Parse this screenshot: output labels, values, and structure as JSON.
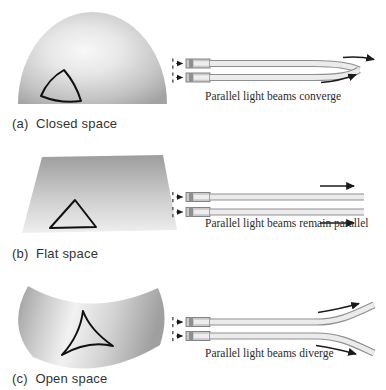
{
  "figure": {
    "panels": [
      {
        "id": "a",
        "label": "(a)  Closed space",
        "caption": "Parallel light beams converge",
        "surface": "dome",
        "triangle_style": "sides bulge outward",
        "beam_behavior": "converge"
      },
      {
        "id": "b",
        "label": "(b)  Flat space",
        "caption": "Parallel light beams remain parallel",
        "surface": "flat plane",
        "triangle_style": "straight sides",
        "beam_behavior": "remain parallel"
      },
      {
        "id": "c",
        "label": "(c)  Open space",
        "caption": "Parallel light beams diverge",
        "surface": "saddle",
        "triangle_style": "sides curve inward",
        "beam_behavior": "diverge"
      }
    ],
    "icons": {
      "light_source": "flashlight-rect",
      "direction_arrow": "→"
    },
    "colors": {
      "background": "#ffffff",
      "surface_highlight": "#f6f6f6",
      "surface_shadow": "#a0a0a0",
      "triangle_outline": "#111111",
      "beam_fill": "#ebebeb",
      "beam_edge": "#8f8f8f",
      "arrow": "#1a1a1a",
      "label_text": "#333333",
      "caption_text": "#2b2b2b"
    }
  }
}
